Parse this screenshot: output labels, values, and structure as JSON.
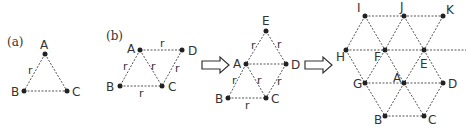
{
  "panels": {
    "a": {
      "label": "(a)",
      "nodes": {
        "A": "A",
        "B": "B",
        "C": "C"
      },
      "edge_labels": [
        "r"
      ]
    },
    "b": {
      "label": "(b)",
      "nodes": {
        "A": "A",
        "B": "B",
        "C": "C",
        "D": "D"
      },
      "edge_labels": [
        "r",
        "r",
        "r",
        "r",
        "r"
      ]
    },
    "c": {
      "nodes": {
        "A": "A",
        "B": "B",
        "C": "C",
        "D": "D",
        "E": "E"
      },
      "edge_labels": [
        "r",
        "r",
        "r",
        "r",
        "r",
        "r"
      ]
    },
    "d": {
      "nodes": {
        "A": "A",
        "B": "B",
        "C": "C",
        "D": "D",
        "E": "E",
        "F": "F",
        "G": "G",
        "H": "H",
        "I": "I",
        "J": "J",
        "K": "K"
      }
    }
  },
  "arrows": [
    "hollow-right-arrow",
    "hollow-right-arrow"
  ],
  "colors": {
    "edge": "#555555",
    "node": "#222222",
    "text": "#333333"
  }
}
